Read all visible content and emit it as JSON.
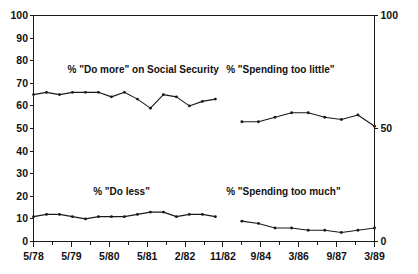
{
  "chart_data": {
    "type": "line",
    "title": "",
    "subtitle": "",
    "xlabel": "",
    "ylabel": "",
    "ylim": [
      0,
      100
    ],
    "y2lim": [
      0,
      100
    ],
    "grid": false,
    "legend_position": "inline-annotations",
    "axis": {
      "left_ticks": [
        "100",
        "90",
        "80",
        "70",
        "60",
        "50",
        "40",
        "30",
        "20",
        "10",
        "0"
      ],
      "left_tick_values": [
        100,
        90,
        80,
        70,
        60,
        50,
        40,
        30,
        20,
        10,
        0
      ],
      "right_ticks": [
        "100",
        "50",
        "0"
      ],
      "right_tick_values": [
        100,
        50,
        0
      ],
      "x_tick_labels_left": [
        "5/78",
        "5/79",
        "5/80",
        "5/81",
        "2/82",
        "11/82"
      ],
      "x_tick_labels_right": [
        "11/82",
        "9/84",
        "3/86",
        "9/87",
        "3/89"
      ],
      "x_tick_labels_all": [
        "5/78",
        "5/79",
        "5/80",
        "5/81",
        "2/82",
        "11/82",
        "9/84",
        "3/86",
        "9/87",
        "3/89"
      ]
    },
    "annotations": [
      {
        "text": "% \"Do more\" on Social Security",
        "x": 0.1,
        "y": 76
      },
      {
        "text": "% \"Spending too little\"",
        "x": 0.565,
        "y": 76
      },
      {
        "text": "% \"Do less\"",
        "x": 0.175,
        "y": 22
      },
      {
        "text": "% \"Spending too much\"",
        "x": 0.565,
        "y": 22
      }
    ],
    "series": [
      {
        "name": "% \"Do more\" on Social Security",
        "panel": "left",
        "marker": "dot",
        "values": [
          65,
          66,
          65,
          66,
          66,
          66,
          64,
          66,
          63,
          59,
          65,
          64,
          60,
          62,
          63
        ]
      },
      {
        "name": "% \"Do less\"",
        "panel": "left",
        "marker": "dot",
        "values": [
          11,
          12,
          12,
          11,
          10,
          11,
          11,
          11,
          12,
          13,
          13,
          11,
          12,
          12,
          11
        ]
      },
      {
        "name": "% \"Spending too little\"",
        "panel": "right",
        "marker": "dot",
        "values": [
          53,
          53,
          55,
          57,
          57,
          55,
          54,
          56,
          51
        ]
      },
      {
        "name": "% \"Spending too much\"",
        "panel": "right",
        "marker": "dot",
        "values": [
          9,
          8,
          6,
          6,
          5,
          5,
          4,
          5,
          6
        ]
      }
    ]
  }
}
